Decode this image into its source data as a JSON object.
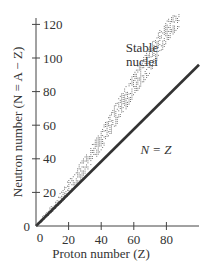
{
  "chart_data": {
    "type": "scatter",
    "title": "",
    "xlabel": "Proton number (Z)",
    "ylabel": "Neutron number (N = A − Z)",
    "xlim": [
      0,
      100
    ],
    "ylim": [
      0,
      128
    ],
    "xticks": [
      0,
      20,
      40,
      60,
      80
    ],
    "yticks": [
      0,
      20,
      40,
      60,
      80,
      100,
      120
    ],
    "grid": false,
    "series": [
      {
        "name": "Stable nuclei",
        "style": "dotted band",
        "band": [
          {
            "z": 0,
            "n_low": 0,
            "n_high": 2
          },
          {
            "z": 10,
            "n_low": 9,
            "n_high": 13
          },
          {
            "z": 20,
            "n_low": 19,
            "n_high": 28
          },
          {
            "z": 30,
            "n_low": 32,
            "n_high": 42
          },
          {
            "z": 40,
            "n_low": 46,
            "n_high": 58
          },
          {
            "z": 50,
            "n_low": 62,
            "n_high": 76
          },
          {
            "z": 60,
            "n_low": 78,
            "n_high": 92
          },
          {
            "z": 70,
            "n_low": 92,
            "n_high": 108
          },
          {
            "z": 80,
            "n_low": 110,
            "n_high": 124
          },
          {
            "z": 90,
            "n_low": 122,
            "n_high": 128
          }
        ]
      },
      {
        "name": "N = Z",
        "style": "solid line",
        "x": [
          0,
          100
        ],
        "y": [
          0,
          96
        ]
      }
    ],
    "annotations": [
      {
        "text_line1": "Stable",
        "text_line2": "nuclei"
      },
      {
        "text": "N = Z"
      }
    ]
  },
  "labels": {
    "xlabel": "Proton number (Z)",
    "ylabel": "Neutron number (N = A − Z)",
    "stable_1": "Stable",
    "stable_2": "nuclei",
    "nz": "N = Z",
    "origin_y": "0",
    "origin_x": "0"
  }
}
